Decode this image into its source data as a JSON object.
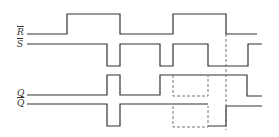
{
  "diagram": {
    "signals": [
      {
        "name": "R",
        "label": "R",
        "inverted": true
      },
      {
        "name": "S",
        "label": "S",
        "inverted": true
      },
      {
        "name": "Q",
        "label": "Q",
        "inverted": false
      },
      {
        "name": "Qbar",
        "label": "Q",
        "inverted": true
      }
    ],
    "colors": {
      "line": "#333333",
      "dashed": "#666666"
    }
  }
}
